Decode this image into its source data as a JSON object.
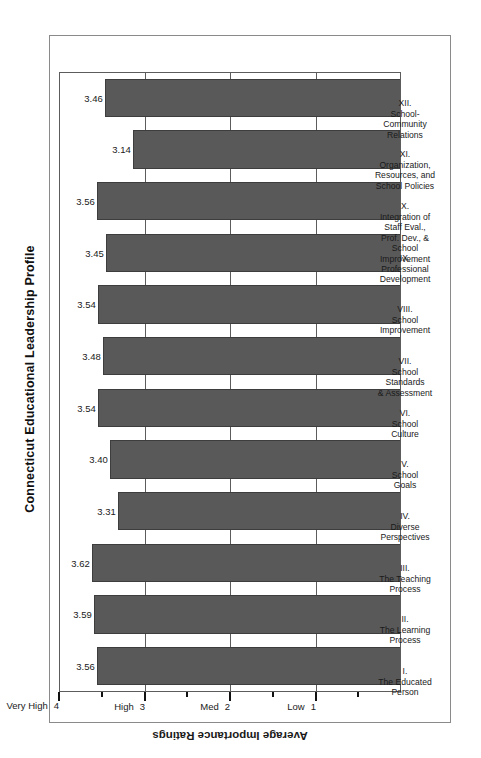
{
  "chart_data": {
    "type": "bar",
    "title": "Connecticut Educational Leadership Profile",
    "xlabel": "",
    "ylabel": "Average Importance Ratings",
    "orientation": "vertical-bars-rotated-page",
    "ylim": [
      0,
      4
    ],
    "grid": true,
    "legend": "none",
    "ytick_values": [
      4,
      3,
      2,
      1
    ],
    "ytick_labels": [
      "Very High",
      "High",
      "Med",
      "Low"
    ],
    "ytick_numbers": [
      "4",
      "3",
      "2",
      "1"
    ],
    "minor_ticks": [
      3.5,
      2.5,
      1.5,
      0.5
    ],
    "categories": [
      "I. The Educated Person",
      "II. The Learning Process",
      "III. The Teaching Process",
      "IV. Diverse Perspectives",
      "V. School Goals",
      "VI. School Culture",
      "VII. School Standards & Assessment",
      "VIII. School Improvement",
      "IX. Professional Development",
      "X. Integration of Staff Eval., Prof. Dev., & School Improvement",
      "XI. Organization, Resources, and School Policies",
      "XII. School-Community Relations"
    ],
    "values": [
      3.56,
      3.59,
      3.62,
      3.31,
      3.4,
      3.54,
      3.48,
      3.54,
      3.45,
      3.56,
      3.14,
      3.46
    ],
    "value_labels": [
      "3.56",
      "3.59",
      "3.62",
      "3.31",
      "3.40",
      "3.54",
      "3.48",
      "3.54",
      "3.45",
      "3.56",
      "3.14",
      "3.46"
    ],
    "bar_color": "#595959",
    "bar_edge_color": "#3d3d3d",
    "axis_color": "#5c5c5c",
    "background": "#ffffff"
  },
  "categories_detail": [
    {
      "roman": "I.",
      "lines": [
        "The Educated",
        "Person"
      ]
    },
    {
      "roman": "II.",
      "lines": [
        "The Learning",
        "Process"
      ]
    },
    {
      "roman": "III.",
      "lines": [
        "The Teaching",
        "Process"
      ]
    },
    {
      "roman": "IV.",
      "lines": [
        "Diverse",
        "Perspectives"
      ]
    },
    {
      "roman": "V.",
      "lines": [
        "School",
        "Goals"
      ]
    },
    {
      "roman": "VI.",
      "lines": [
        "School",
        "Culture"
      ]
    },
    {
      "roman": "VII.",
      "lines": [
        "School",
        "Standards",
        "& Assessment"
      ]
    },
    {
      "roman": "VIII.",
      "lines": [
        "School",
        "Improvement"
      ]
    },
    {
      "roman": "IX.",
      "lines": [
        "Professional",
        "Development"
      ]
    },
    {
      "roman": "X.",
      "lines": [
        "Integration of",
        "Staff Eval.,",
        "Prof. Dev., &",
        "School",
        "Improvement"
      ]
    },
    {
      "roman": "XI.",
      "lines": [
        "Organization,",
        "Resources, and",
        "School Policies"
      ]
    },
    {
      "roman": "XII.",
      "lines": [
        "School-",
        "Community",
        "Relations"
      ]
    }
  ],
  "axis": {
    "title": "Average Importance Ratings",
    "ticks": [
      {
        "label": "Very High",
        "number": "4"
      },
      {
        "label": "High",
        "number": "3"
      },
      {
        "label": "Med",
        "number": "2"
      },
      {
        "label": "Low",
        "number": "1"
      }
    ]
  },
  "header": {
    "title": "Connecticut Educational Leadership Profile"
  }
}
